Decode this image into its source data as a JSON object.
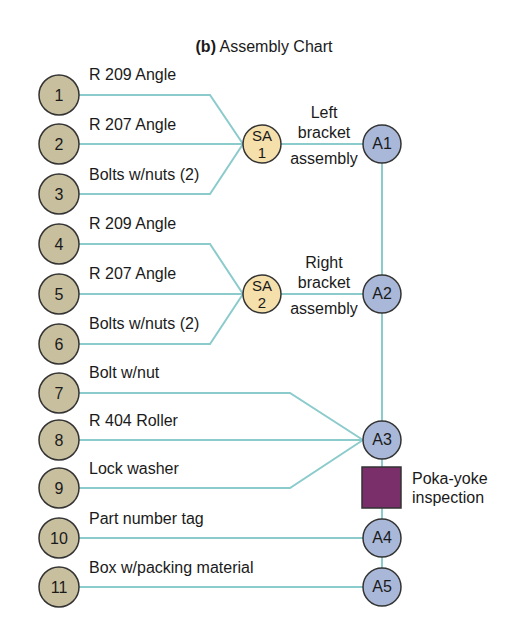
{
  "title": {
    "prefix": "(b)",
    "text": "Assembly Chart"
  },
  "colors": {
    "line": "#8ccbcc",
    "component_fill": "#c8bf9f",
    "subassembly_fill": "#f5dfaa",
    "assembly_fill": "#a9b8d8",
    "inspection_fill": "#7a2e6a",
    "stroke": "#333333"
  },
  "components": [
    {
      "id": "1",
      "label": "R 209 Angle"
    },
    {
      "id": "2",
      "label": "R 207 Angle"
    },
    {
      "id": "3",
      "label": "Bolts w/nuts (2)"
    },
    {
      "id": "4",
      "label": "R 209 Angle"
    },
    {
      "id": "5",
      "label": "R 207 Angle"
    },
    {
      "id": "6",
      "label": "Bolts w/nuts (2)"
    },
    {
      "id": "7",
      "label": "Bolt w/nut"
    },
    {
      "id": "8",
      "label": "R 404 Roller"
    },
    {
      "id": "9",
      "label": "Lock washer"
    },
    {
      "id": "10",
      "label": "Part number tag"
    },
    {
      "id": "11",
      "label": "Box w/packing material"
    }
  ],
  "subassemblies": [
    {
      "line1": "SA",
      "line2": "1",
      "desc": [
        "Left",
        "bracket",
        "assembly"
      ]
    },
    {
      "line1": "SA",
      "line2": "2",
      "desc": [
        "Right",
        "bracket",
        "assembly"
      ]
    }
  ],
  "assemblies": [
    "A1",
    "A2",
    "A3",
    "A4",
    "A5"
  ],
  "inspection": {
    "line1": "Poka-yoke",
    "line2": "inspection"
  }
}
